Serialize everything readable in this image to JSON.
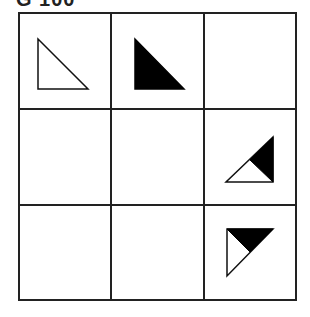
{
  "title": "G 100",
  "grid": {
    "rows": 3,
    "cols": 3,
    "line_color": "#222222",
    "fill_color": "#000000",
    "cells": [
      {
        "row": 0,
        "col": 0,
        "content": "outline right triangle (right angle bottom-left)"
      },
      {
        "row": 0,
        "col": 1,
        "content": "filled black right triangle (right angle bottom-left)"
      },
      {
        "row": 0,
        "col": 2,
        "content": "empty"
      },
      {
        "row": 1,
        "col": 0,
        "content": "empty"
      },
      {
        "row": 1,
        "col": 1,
        "content": "empty"
      },
      {
        "row": 1,
        "col": 2,
        "content": "right triangle (right angle bottom-right), upper-right half black"
      },
      {
        "row": 2,
        "col": 0,
        "content": "empty"
      },
      {
        "row": 2,
        "col": 1,
        "content": "empty"
      },
      {
        "row": 2,
        "col": 2,
        "content": "right triangle (right angle top-left), upper-right half black"
      }
    ]
  }
}
